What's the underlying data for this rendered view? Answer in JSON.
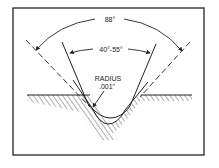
{
  "diagram": {
    "outer_angle_label": "88°",
    "inner_angle_label": "40°-55°",
    "radius_label_line1": "RADIUS",
    "radius_label_line2": ".001\"",
    "colors": {
      "ink": "#222222",
      "background": "#ffffff"
    }
  }
}
